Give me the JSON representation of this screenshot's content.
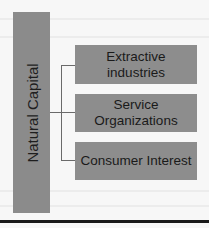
{
  "diagram": {
    "root": {
      "label": "Natural Capital"
    },
    "children": [
      {
        "label": "Extractive industries"
      },
      {
        "label": "Service Organizations"
      },
      {
        "label": "Consumer Interest"
      }
    ],
    "colors": {
      "box_fill": "#8d8d8d",
      "text": "#1a1a1a",
      "connector": "#6a6a6a",
      "rule": "#1a1a1a"
    }
  }
}
